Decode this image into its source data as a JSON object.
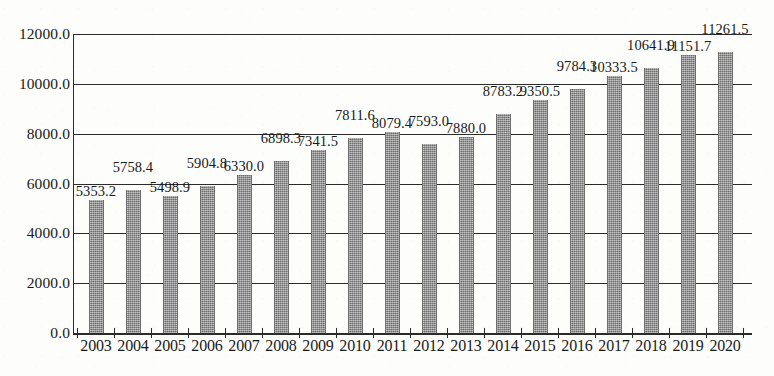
{
  "chart_data": {
    "type": "bar",
    "title": "",
    "subtitle": "",
    "xlabel": "",
    "ylabel": "",
    "categories": [
      "2003",
      "2004",
      "2005",
      "2006",
      "2007",
      "2008",
      "2009",
      "2010",
      "2011",
      "2012",
      "2013",
      "2014",
      "2015",
      "2016",
      "2017",
      "2018",
      "2019",
      "2020"
    ],
    "values": [
      5353.2,
      5758.4,
      5498.9,
      5904.8,
      6330.0,
      6898.3,
      7341.5,
      7811.6,
      8079.4,
      7593.0,
      7880.0,
      8783.2,
      9350.5,
      9784.3,
      10333.5,
      10641.9,
      11151.7,
      11261.5
    ],
    "data_labels": [
      "5353.2",
      "5758.4",
      "5498.9",
      "5904.8",
      "6330.0",
      "6898.3",
      "7341.5",
      "7811.6",
      "8079.4",
      "7593.0",
      "7880.0",
      "8783.2",
      "9350.5",
      "9784.3",
      "10333.5",
      "10641.9",
      "11151.7",
      "11261.5"
    ],
    "ylim": [
      0,
      12000
    ],
    "ytick_values": [
      0,
      2000,
      4000,
      6000,
      8000,
      10000,
      12000
    ],
    "ytick_labels": [
      "0.0",
      "2000.0",
      "4000.0",
      "6000.0",
      "8000.0",
      "10000.0",
      "12000.0"
    ],
    "grid": true,
    "grid_axis": "y",
    "legend": false,
    "legend_position": "none",
    "series": [
      {
        "name": "",
        "values": [
          5353.2,
          5758.4,
          5498.9,
          5904.8,
          6330.0,
          6898.3,
          7341.5,
          7811.6,
          8079.4,
          7593.0,
          7880.0,
          8783.2,
          9350.5,
          9784.3,
          10333.5,
          10641.9,
          11151.7,
          11261.5
        ]
      }
    ],
    "colors": {
      "bar_fill": "#8c8c8c",
      "axis": "#2b2b2b",
      "text": "#1a1a1a",
      "background": "#fdfdfb"
    }
  }
}
